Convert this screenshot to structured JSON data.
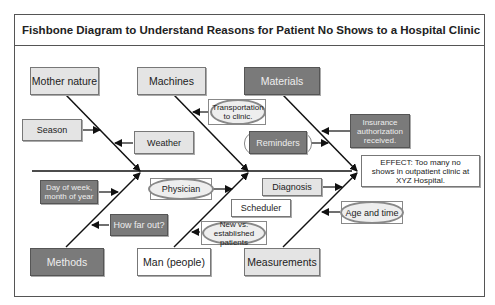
{
  "title": "Fishbone Diagram to Understand Reasons for Patient No Shows to a Hospital Clinic",
  "effect": "EFFECT: Too many no shows in outpatient clinic at XYZ Hospital.",
  "categories": {
    "mother_nature": "Mother nature",
    "machines": "Machines",
    "materials": "Materials",
    "methods": "Methods",
    "man": "Man (people)",
    "measurements": "Measurements"
  },
  "causes": {
    "season": "Season",
    "weather": "Weather",
    "transportation": "Transportation to clinic.",
    "reminders": "Reminders",
    "insurance": "Insurance authorization received.",
    "day_of_week": "Day of week, month of year",
    "how_far_out": "How far out?",
    "physician": "Physician",
    "new_vs_established": "New vs. established patients",
    "scheduler": "Scheduler",
    "diagnosis": "Diagnosis",
    "age_and_time": "Age and time"
  },
  "colors": {
    "dark_box": "#7a7a7a",
    "light_box": "#e4e4e4",
    "line": "#111111"
  }
}
